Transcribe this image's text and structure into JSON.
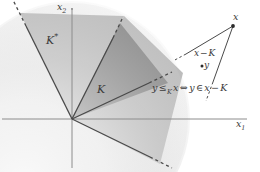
{
  "figure": {
    "background_color": "#ffffff",
    "axes": {
      "x_axis_label": "x",
      "x_axis_subscript": "1",
      "y_axis_label": "x",
      "y_axis_subscript": "2",
      "axis_color": "#808080",
      "origin": {
        "x": 72,
        "y": 119
      }
    },
    "regions": [
      {
        "name": "dual-cone",
        "label": "K",
        "label_superscript": "*",
        "fill_color": "#b9b9b9",
        "description": "wide light-gray cone opening upward from the origin"
      },
      {
        "name": "cone",
        "label": "K",
        "label_superscript": "",
        "fill_color": "#848484",
        "description": "narrow mid-gray cone opening up-right from the origin"
      }
    ],
    "points": [
      {
        "name": "x",
        "label": "x",
        "cx": 233,
        "cy": 26
      },
      {
        "name": "y",
        "label": "y",
        "cx": 203,
        "cy": 66
      }
    ],
    "annotations": {
      "translated_cone_label": "x",
      "translated_cone_operator": "−",
      "translated_cone_set": "K",
      "formula_lhs": "y",
      "formula_relation": "≤",
      "formula_relation_subscript": "K",
      "formula_arg": "x",
      "formula_iff": "⇔",
      "formula_rhs_member": "y",
      "formula_in": "∈",
      "formula_rhs_set_a": "x",
      "formula_rhs_op": "−",
      "formula_rhs_set_b": "K"
    },
    "colors": {
      "line": "#4a4a4a",
      "text": "#3a3a3a",
      "axis": "#8c8c8c",
      "cone_fill": "#848484",
      "dual_cone_fill": "#b9b9b9"
    }
  }
}
